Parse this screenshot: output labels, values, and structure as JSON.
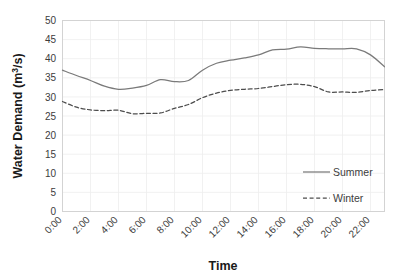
{
  "chart_data": {
    "type": "line",
    "title": "",
    "xlabel": "Time",
    "ylabel": "Water Demand (m³/s)",
    "ylabel_parts": {
      "main": "Water Demand (m",
      "sup": "3",
      "tail": "/s)"
    },
    "xlim": [
      0,
      23
    ],
    "ylim": [
      0,
      50
    ],
    "grid": true,
    "legend_position": "inside-bottom-right",
    "x": [
      0,
      1,
      2,
      3,
      4,
      5,
      6,
      7,
      8,
      9,
      10,
      11,
      12,
      13,
      14,
      15,
      16,
      17,
      18,
      19,
      20,
      21,
      22,
      23
    ],
    "categories": [
      "0:00",
      "1:00",
      "2:00",
      "3:00",
      "4:00",
      "5:00",
      "6:00",
      "7:00",
      "8:00",
      "9:00",
      "10:00",
      "11:00",
      "12:00",
      "13:00",
      "14:00",
      "15:00",
      "16:00",
      "17:00",
      "18:00",
      "19:00",
      "20:00",
      "21:00",
      "22:00",
      "23:00"
    ],
    "xticks": [
      "0:00",
      "2:00",
      "4:00",
      "6:00",
      "8:00",
      "10:00",
      "12:00",
      "14:00",
      "16:00",
      "18:00",
      "20:00",
      "22:00"
    ],
    "xtick_values": [
      0,
      2,
      4,
      6,
      8,
      10,
      12,
      14,
      16,
      18,
      20,
      22
    ],
    "yticks": [
      "0",
      "5",
      "10",
      "15",
      "20",
      "25",
      "30",
      "35",
      "40",
      "45",
      "50"
    ],
    "ytick_values": [
      0,
      5,
      10,
      15,
      20,
      25,
      30,
      35,
      40,
      45,
      50
    ],
    "series": [
      {
        "name": "Summer",
        "style": "solid",
        "color": "#7a7a7a",
        "values": [
          37.0,
          35.6,
          34.3,
          32.8,
          32.0,
          32.3,
          33.0,
          34.5,
          34.0,
          34.3,
          37.0,
          38.8,
          39.6,
          40.2,
          41.0,
          42.3,
          42.5,
          43.1,
          42.7,
          42.6,
          42.6,
          42.6,
          42.5,
          42.4
        ]
      },
      {
        "name": "Winter",
        "style": "dashed",
        "color": "#4d4d4d",
        "values": [
          28.8,
          27.3,
          26.6,
          26.4,
          26.5,
          25.6,
          25.7,
          25.8,
          27.0,
          28.0,
          29.8,
          31.0,
          31.7,
          32.0,
          32.2,
          32.7,
          33.2,
          33.3,
          32.7,
          31.3,
          31.3,
          31.2,
          31.7,
          31.9
        ]
      }
    ],
    "series_full": {
      "Summer": [
        37.0,
        35.6,
        34.3,
        32.8,
        32.0,
        32.3,
        33.0,
        34.5,
        34.0,
        34.3,
        37.0,
        38.8,
        39.6,
        40.2,
        41.0,
        42.3,
        42.5,
        43.1,
        42.7,
        42.6,
        42.6,
        42.6,
        41.0,
        37.9
      ],
      "Winter": [
        28.8,
        27.3,
        26.6,
        26.4,
        26.5,
        25.6,
        25.7,
        25.8,
        27.0,
        28.0,
        29.8,
        31.0,
        31.7,
        32.0,
        32.2,
        32.7,
        33.2,
        33.3,
        32.7,
        31.3,
        31.3,
        31.2,
        31.7,
        31.9
      ]
    },
    "annotations": []
  },
  "legend": {
    "entries": [
      {
        "label": "Summer",
        "style": "solid",
        "color": "#7a7a7a"
      },
      {
        "label": "Winter",
        "style": "dashed",
        "color": "#4d4d4d"
      }
    ]
  },
  "axes": {
    "x_title": "Time",
    "y_title_main": "Water Demand (m",
    "y_title_sup": "3",
    "y_title_tail": "/s)"
  }
}
